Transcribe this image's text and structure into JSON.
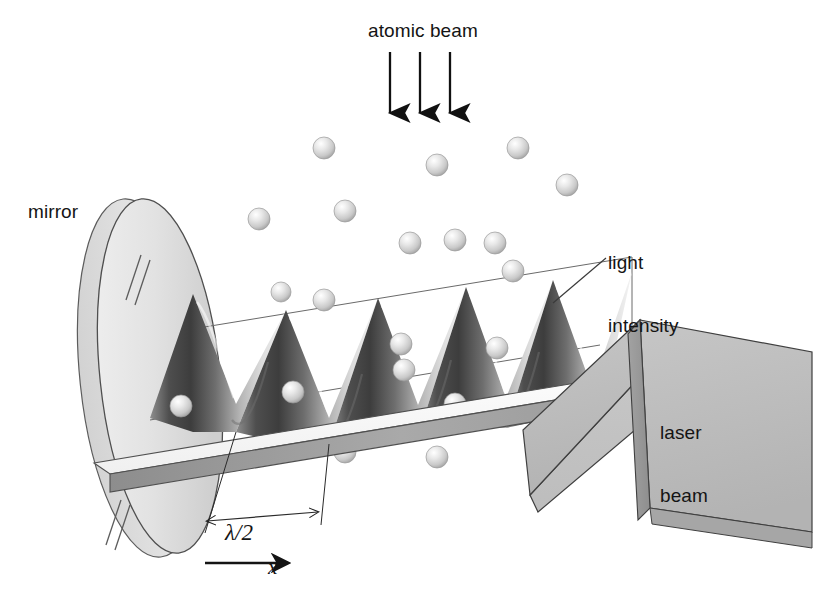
{
  "figure": {
    "background_color": "#ffffff",
    "ink_color": "#141414",
    "surface_light": "#f2f2f2",
    "surface_mid": "#b9b9b9",
    "surface_dark": "#4a4a4a",
    "sphere_color": "#dedede"
  },
  "labels": {
    "atomic_beam": "atomic beam",
    "mirror": "mirror",
    "light_intensity_line1": "light",
    "light_intensity_line2": "intensity",
    "laser_beam_line1": "laser",
    "laser_beam_line2": "beam",
    "lambda_half": "λ/2",
    "x_axis": "x"
  },
  "annotations": {
    "beam_arrows": [
      {
        "x": 390,
        "y1": 52,
        "y2": 113
      },
      {
        "x": 420,
        "y1": 52,
        "y2": 113
      },
      {
        "x": 450,
        "y1": 52,
        "y2": 113
      }
    ],
    "light_intensity_leader": {
      "x1": 606,
      "y1": 258,
      "x2": 553,
      "y2": 303
    },
    "lambda_dimension": {
      "x1": 207,
      "y1": 521,
      "x2": 318,
      "y2": 512,
      "ticks": [
        207,
        318
      ]
    },
    "x_arrow": {
      "x1": 205,
      "y1": 563,
      "x2": 288,
      "y2": 563
    }
  },
  "chart_data": {
    "type": "line",
    "title": "light intensity",
    "xlabel": "x",
    "ylabel": "light intensity",
    "period_label": "λ/2",
    "cycles_shown": 5,
    "x": [
      0,
      0.125,
      0.25,
      0.375,
      0.5,
      0.625,
      0.75,
      0.875,
      1.0
    ],
    "values": [
      1,
      0.5,
      0,
      0.5,
      1,
      0.5,
      0,
      0.5,
      1
    ],
    "grid": false,
    "legend": false
  },
  "atoms": {
    "falling": [
      {
        "cx": 324,
        "cy": 148,
        "r": 11
      },
      {
        "cx": 437,
        "cy": 165,
        "r": 11
      },
      {
        "cx": 518,
        "cy": 148,
        "r": 11
      },
      {
        "cx": 259,
        "cy": 219,
        "r": 11
      },
      {
        "cx": 345,
        "cy": 211,
        "r": 11
      },
      {
        "cx": 567,
        "cy": 185,
        "r": 11
      },
      {
        "cx": 410,
        "cy": 243,
        "r": 11
      },
      {
        "cx": 455,
        "cy": 240,
        "r": 11
      },
      {
        "cx": 495,
        "cy": 243,
        "r": 11
      },
      {
        "cx": 513,
        "cy": 271,
        "r": 11
      },
      {
        "cx": 281,
        "cy": 292,
        "r": 10
      }
    ],
    "trapped": [
      {
        "cx": 324,
        "cy": 300,
        "r": 11
      },
      {
        "cx": 401,
        "cy": 344,
        "r": 11
      },
      {
        "cx": 404,
        "cy": 370,
        "r": 11
      },
      {
        "cx": 497,
        "cy": 348,
        "r": 11
      },
      {
        "cx": 455,
        "cy": 404,
        "r": 11
      },
      {
        "cx": 293,
        "cy": 392,
        "r": 11
      },
      {
        "cx": 181,
        "cy": 406,
        "r": 11
      },
      {
        "cx": 345,
        "cy": 452,
        "r": 11
      },
      {
        "cx": 437,
        "cy": 457,
        "r": 11
      }
    ]
  }
}
